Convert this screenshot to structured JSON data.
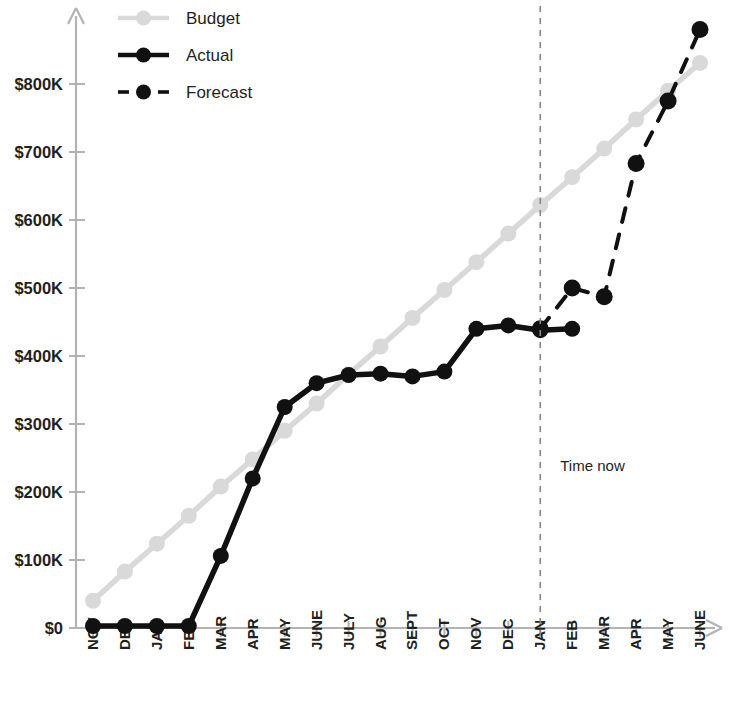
{
  "chart_data": {
    "type": "line",
    "title": "",
    "xlabel": "",
    "ylabel": "",
    "grid": false,
    "legend_position": "top-left",
    "ylim": [
      0,
      880
    ],
    "ytick_labels": [
      "$0",
      "$100K",
      "$200K",
      "$300K",
      "$400K",
      "$500K",
      "$600K",
      "$700K",
      "$800K"
    ],
    "ytick_values": [
      0,
      100,
      200,
      300,
      400,
      500,
      600,
      700,
      800
    ],
    "y_unit": "thousand USD",
    "categories": [
      "NOV",
      "DEC",
      "JAN",
      "FEB",
      "MAR",
      "APR",
      "MAY",
      "JUNE",
      "JULY",
      "AUG",
      "SEPT",
      "OCT",
      "NOV",
      "DEC",
      "JAN",
      "FEB",
      "MAR",
      "APR",
      "MAY",
      "JUNE"
    ],
    "series": [
      {
        "name": "Budget",
        "style": "solid",
        "color": "#d9d9d9",
        "marker": "circle",
        "values": [
          40,
          83,
          124,
          165,
          208,
          248,
          290,
          330,
          373,
          414,
          456,
          497,
          538,
          580,
          622,
          663,
          705,
          748,
          790,
          831
        ]
      },
      {
        "name": "Actual",
        "style": "solid",
        "color": "#111111",
        "marker": "circle",
        "values": [
          3,
          3,
          3,
          3,
          106,
          220,
          325,
          360,
          372,
          374,
          370,
          377,
          440,
          445,
          438,
          440,
          null,
          null,
          null,
          null
        ]
      },
      {
        "name": "Forecast",
        "style": "dashed",
        "color": "#111111",
        "marker": "circle",
        "values": [
          null,
          null,
          null,
          null,
          null,
          null,
          null,
          null,
          null,
          null,
          null,
          null,
          null,
          null,
          440,
          500,
          487,
          683,
          775,
          880
        ]
      }
    ],
    "annotations": [
      {
        "text": "Time now",
        "x_category": "JAN",
        "kind": "vertical-dashed-line-label"
      }
    ]
  },
  "legend": {
    "items": [
      {
        "label": "Budget"
      },
      {
        "label": "Actual"
      },
      {
        "label": "Forecast"
      }
    ]
  },
  "axes": {
    "y_arrow": true,
    "x_arrow": true
  }
}
